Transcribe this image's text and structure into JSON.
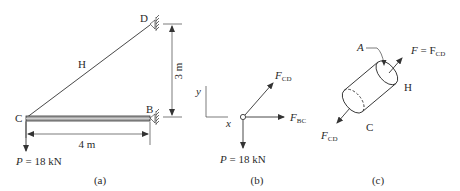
{
  "figure_a": {
    "label_C": "C",
    "label_B": "B",
    "label_D": "D",
    "label_H": "H",
    "dim_vertical": "3 m",
    "dim_horizontal": "4 m",
    "load_symbol": "P",
    "load_value": " = 18 kN",
    "caption": "(a)"
  },
  "figure_b": {
    "axis_y": "y",
    "axis_x": "x",
    "force_cd": "F",
    "force_cd_sub": "CD",
    "force_bc": "F",
    "force_bc_sub": "BC",
    "load_symbol": "P",
    "load_value": " = 18 kN",
    "caption": "(b)"
  },
  "figure_c": {
    "label_A": "A",
    "force_top": "F",
    "force_top_eq": " = F",
    "force_top_sub": "CD",
    "label_H": "H",
    "label_C": "C",
    "force_bottom": "F",
    "force_bottom_sub": "CD",
    "caption": "(c)"
  },
  "colors": {
    "ink": "#2a2a2a",
    "beam_fill": "#9a9a9a"
  }
}
